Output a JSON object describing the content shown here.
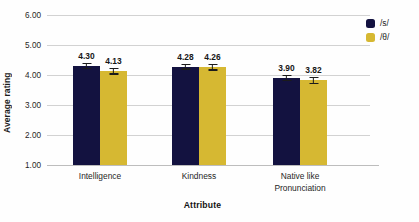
{
  "chart_data": {
    "type": "bar",
    "title": "",
    "xlabel": "Attribute",
    "ylabel": "Average rating",
    "categories": [
      "Intelligence",
      "Kindness",
      "Native like\nPronunciation"
    ],
    "series": [
      {
        "name": "/s/",
        "color": "#131240",
        "values": [
          4.3,
          4.28,
          3.9
        ],
        "errors": [
          0.11,
          0.1,
          0.11
        ]
      },
      {
        "name": "/θ/",
        "color": "#d6b832",
        "values": [
          4.13,
          4.26,
          3.82
        ],
        "errors": [
          0.12,
          0.11,
          0.12
        ]
      }
    ],
    "value_labels": [
      [
        "4.30",
        "4.13"
      ],
      [
        "4.28",
        "4.26"
      ],
      [
        "3.90",
        "3.82"
      ]
    ],
    "ylim": [
      1.0,
      6.0
    ],
    "yticks": [
      "6.00",
      "5.00",
      "4.00",
      "3.00",
      "2.00",
      "1.00"
    ],
    "ytick_values": [
      6.0,
      5.0,
      4.0,
      3.0,
      2.0,
      1.0
    ],
    "grid": true,
    "legend_position": "right-top",
    "legend": [
      {
        "label": "/s/",
        "color": "#131240"
      },
      {
        "label": "/θ/",
        "color": "#d6b832"
      }
    ]
  }
}
